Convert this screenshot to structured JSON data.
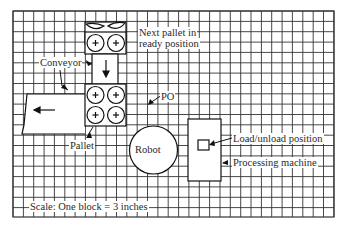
{
  "diagram": {
    "grid": {
      "left": 13,
      "top": 11,
      "right": 334,
      "bottom": 217,
      "cell": 10.35,
      "line_color": "#333333"
    },
    "labels": {
      "next_pallet_line1": "Next pallet in",
      "next_pallet_line2": "ready position",
      "conveyor": "Conveyor",
      "po": "PO",
      "pallet": "Pallet",
      "robot": "Robot",
      "load_unload": "Load/unload position",
      "processing_machine": "Processing machine",
      "scale": "Scale: One block = 3 inches"
    },
    "components": {
      "next_pallets": {
        "count": 2,
        "position": "top"
      },
      "conveyor_pallets": {
        "rows": 2,
        "cols": 2
      },
      "robot": {
        "shape": "circle"
      },
      "processing_machine": {
        "shape": "rectangle"
      },
      "load_unload_position": {
        "shape": "small square"
      }
    },
    "scale": {
      "block": 1,
      "inches": 3
    }
  }
}
